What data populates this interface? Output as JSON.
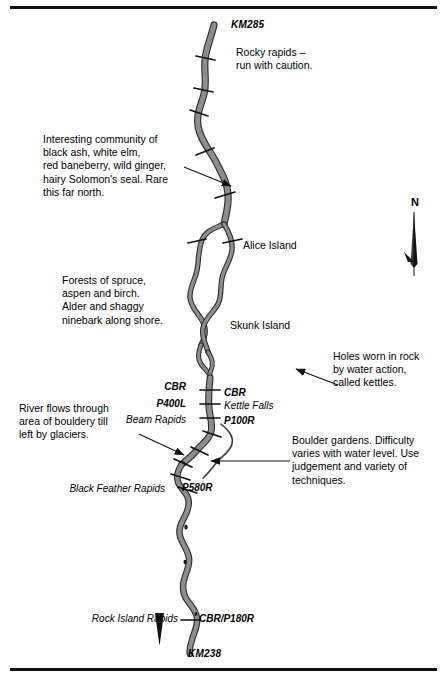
{
  "map": {
    "title": "River Route Map",
    "river_color": "#8d8d8d",
    "river_outline_color": "#2b2b2b",
    "ink_color": "#000000",
    "background_color": "#ffffff",
    "rule_color": "#101010"
  },
  "compass": {
    "label": "N",
    "icon": "north-arrow-icon"
  },
  "kilometre_markers": [
    {
      "id": "km-285",
      "label": "KM285"
    },
    {
      "id": "km-238",
      "label": "KM238"
    }
  ],
  "annotations": [
    {
      "id": "rocky-rapids-note",
      "text": "Rocky rapids –\nrun with caution."
    },
    {
      "id": "vegetation-community-note",
      "text": "Interesting community of\nblack ash, white elm,\nred baneberry, wild ginger,\nhairy Solomon's seal. Rare\nthis far north."
    },
    {
      "id": "forest-note",
      "text": "Forests of spruce,\naspen and birch.\nAlder and shaggy\nninebark along shore."
    },
    {
      "id": "kettles-note",
      "text": "Holes worn in rock\nby water action,\ncalled kettles."
    },
    {
      "id": "boulder-till-note",
      "text": "River flows through\narea of bouldery till\nleft by glaciers."
    },
    {
      "id": "boulder-gardens-note",
      "text": "Boulder gardens. Difficulty\nvaries with water level. Use\njudgement and variety of\ntechniques."
    }
  ],
  "islands": [
    {
      "id": "alice-island",
      "label": "Alice Island"
    },
    {
      "id": "skunk-island",
      "label": "Skunk Island"
    }
  ],
  "rapids": [
    {
      "id": "beam-rapids",
      "label": "Beam Rapids"
    },
    {
      "id": "black-feather-rapids",
      "label": "Black Feather Rapids"
    },
    {
      "id": "rock-island-rapids",
      "label": "Rock Island Rapids"
    },
    {
      "id": "kettle-falls",
      "label": "Kettle Falls"
    }
  ],
  "portages": [
    {
      "id": "cbr-upper",
      "label": "CBR"
    },
    {
      "id": "cbr-kettle",
      "label": "CBR"
    },
    {
      "id": "p400l",
      "label": "P400L"
    },
    {
      "id": "p100r",
      "label": "P100R"
    },
    {
      "id": "p580r",
      "label": "P580R"
    },
    {
      "id": "cbr-p180r",
      "label": "CBR/P180R"
    }
  ]
}
